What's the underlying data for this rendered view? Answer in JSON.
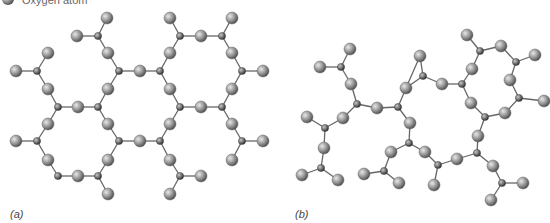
{
  "legend": {
    "oxygen_label": "Oxygen atom"
  },
  "panels": [
    {
      "label": "(a)",
      "description": "crystalline",
      "label_pos": [
        10,
        208
      ]
    },
    {
      "label": "(b)",
      "description": "amorphous",
      "label_pos": [
        295,
        208
      ]
    }
  ],
  "colors": {
    "oxygen": "#8a8a8a",
    "silicon": "#6a6a6a",
    "bond": "#666666"
  },
  "atoms": {
    "O": [
      [
        107,
        18
      ],
      [
        170,
        18
      ],
      [
        232,
        18
      ],
      [
        77,
        36
      ],
      [
        201,
        36
      ],
      [
        108,
        53
      ],
      [
        170,
        53
      ],
      [
        232,
        53
      ],
      [
        140,
        71
      ],
      [
        263,
        71
      ],
      [
        48,
        53
      ],
      [
        16,
        71
      ],
      [
        48,
        89
      ],
      [
        108,
        89
      ],
      [
        170,
        89
      ],
      [
        232,
        89
      ],
      [
        78,
        107
      ],
      [
        201,
        107
      ],
      [
        16,
        141
      ],
      [
        48,
        124
      ],
      [
        48,
        160
      ],
      [
        78,
        176
      ],
      [
        108,
        124
      ],
      [
        108,
        160
      ],
      [
        140,
        141
      ],
      [
        170,
        124
      ],
      [
        170,
        160
      ],
      [
        201,
        176
      ],
      [
        170,
        194
      ],
      [
        108,
        194
      ],
      [
        263,
        141
      ],
      [
        232,
        124
      ],
      [
        232,
        160
      ],
      [
        350,
        49
      ],
      [
        320,
        67
      ],
      [
        351,
        84
      ],
      [
        377,
        108
      ],
      [
        406,
        88
      ],
      [
        420,
        56
      ],
      [
        307,
        117
      ],
      [
        343,
        118
      ],
      [
        324,
        148
      ],
      [
        302,
        175
      ],
      [
        338,
        180
      ],
      [
        467,
        35
      ],
      [
        501,
        46
      ],
      [
        535,
        55
      ],
      [
        472,
        69
      ],
      [
        442,
        84
      ],
      [
        510,
        80
      ],
      [
        544,
        101
      ],
      [
        471,
        103
      ],
      [
        505,
        113
      ],
      [
        410,
        123
      ],
      [
        391,
        152
      ],
      [
        425,
        152
      ],
      [
        457,
        159
      ],
      [
        478,
        136
      ],
      [
        493,
        166
      ],
      [
        523,
        183
      ],
      [
        491,
        200
      ],
      [
        434,
        185
      ],
      [
        364,
        174
      ],
      [
        399,
        183
      ]
    ],
    "Si": [
      [
        98,
        36
      ],
      [
        180,
        36
      ],
      [
        222,
        36
      ],
      [
        119,
        71
      ],
      [
        160,
        71
      ],
      [
        242,
        71
      ],
      [
        37,
        71
      ],
      [
        58,
        107
      ],
      [
        98,
        107
      ],
      [
        180,
        107
      ],
      [
        222,
        107
      ],
      [
        37,
        141
      ],
      [
        58,
        176
      ],
      [
        98,
        176
      ],
      [
        119,
        141
      ],
      [
        160,
        141
      ],
      [
        180,
        176
      ],
      [
        242,
        141
      ],
      [
        341,
        67
      ],
      [
        357,
        104
      ],
      [
        398,
        107
      ],
      [
        325,
        128
      ],
      [
        321,
        168
      ],
      [
        480,
        51
      ],
      [
        516,
        62
      ],
      [
        462,
        84
      ],
      [
        423,
        76
      ],
      [
        519,
        98
      ],
      [
        485,
        117
      ],
      [
        409,
        143
      ],
      [
        438,
        165
      ],
      [
        477,
        153
      ],
      [
        502,
        183
      ],
      [
        384,
        171
      ]
    ]
  },
  "bonds": [
    [
      [
        98,
        36
      ],
      [
        107,
        18
      ]
    ],
    [
      [
        98,
        36
      ],
      [
        77,
        36
      ]
    ],
    [
      [
        98,
        36
      ],
      [
        108,
        53
      ]
    ],
    [
      [
        180,
        36
      ],
      [
        170,
        18
      ]
    ],
    [
      [
        180,
        36
      ],
      [
        201,
        36
      ]
    ],
    [
      [
        180,
        36
      ],
      [
        170,
        53
      ]
    ],
    [
      [
        222,
        36
      ],
      [
        232,
        18
      ]
    ],
    [
      [
        222,
        36
      ],
      [
        201,
        36
      ]
    ],
    [
      [
        222,
        36
      ],
      [
        232,
        53
      ]
    ],
    [
      [
        119,
        71
      ],
      [
        108,
        53
      ]
    ],
    [
      [
        119,
        71
      ],
      [
        140,
        71
      ]
    ],
    [
      [
        119,
        71
      ],
      [
        108,
        89
      ]
    ],
    [
      [
        160,
        71
      ],
      [
        140,
        71
      ]
    ],
    [
      [
        160,
        71
      ],
      [
        170,
        53
      ]
    ],
    [
      [
        160,
        71
      ],
      [
        170,
        89
      ]
    ],
    [
      [
        242,
        71
      ],
      [
        232,
        53
      ]
    ],
    [
      [
        242,
        71
      ],
      [
        263,
        71
      ]
    ],
    [
      [
        242,
        71
      ],
      [
        232,
        89
      ]
    ],
    [
      [
        37,
        71
      ],
      [
        16,
        71
      ]
    ],
    [
      [
        37,
        71
      ],
      [
        48,
        53
      ]
    ],
    [
      [
        37,
        71
      ],
      [
        48,
        89
      ]
    ],
    [
      [
        58,
        107
      ],
      [
        48,
        89
      ]
    ],
    [
      [
        58,
        107
      ],
      [
        78,
        107
      ]
    ],
    [
      [
        58,
        107
      ],
      [
        48,
        124
      ]
    ],
    [
      [
        98,
        107
      ],
      [
        78,
        107
      ]
    ],
    [
      [
        98,
        107
      ],
      [
        108,
        89
      ]
    ],
    [
      [
        98,
        107
      ],
      [
        108,
        124
      ]
    ],
    [
      [
        180,
        107
      ],
      [
        170,
        89
      ]
    ],
    [
      [
        180,
        107
      ],
      [
        201,
        107
      ]
    ],
    [
      [
        180,
        107
      ],
      [
        170,
        124
      ]
    ],
    [
      [
        222,
        107
      ],
      [
        201,
        107
      ]
    ],
    [
      [
        222,
        107
      ],
      [
        232,
        89
      ]
    ],
    [
      [
        222,
        107
      ],
      [
        232,
        124
      ]
    ],
    [
      [
        37,
        141
      ],
      [
        16,
        141
      ]
    ],
    [
      [
        37,
        141
      ],
      [
        48,
        124
      ]
    ],
    [
      [
        37,
        141
      ],
      [
        48,
        160
      ]
    ],
    [
      [
        58,
        176
      ],
      [
        48,
        160
      ]
    ],
    [
      [
        58,
        176
      ],
      [
        78,
        176
      ]
    ],
    [
      [
        98,
        176
      ],
      [
        78,
        176
      ]
    ],
    [
      [
        98,
        176
      ],
      [
        108,
        160
      ]
    ],
    [
      [
        98,
        176
      ],
      [
        108,
        194
      ]
    ],
    [
      [
        119,
        141
      ],
      [
        108,
        124
      ]
    ],
    [
      [
        119,
        141
      ],
      [
        140,
        141
      ]
    ],
    [
      [
        119,
        141
      ],
      [
        108,
        160
      ]
    ],
    [
      [
        160,
        141
      ],
      [
        140,
        141
      ]
    ],
    [
      [
        160,
        141
      ],
      [
        170,
        124
      ]
    ],
    [
      [
        160,
        141
      ],
      [
        170,
        160
      ]
    ],
    [
      [
        180,
        176
      ],
      [
        170,
        160
      ]
    ],
    [
      [
        180,
        176
      ],
      [
        201,
        176
      ]
    ],
    [
      [
        180,
        176
      ],
      [
        170,
        194
      ]
    ],
    [
      [
        242,
        141
      ],
      [
        232,
        124
      ]
    ],
    [
      [
        242,
        141
      ],
      [
        263,
        141
      ]
    ],
    [
      [
        242,
        141
      ],
      [
        232,
        160
      ]
    ],
    [
      [
        341,
        67
      ],
      [
        350,
        49
      ]
    ],
    [
      [
        341,
        67
      ],
      [
        320,
        67
      ]
    ],
    [
      [
        341,
        67
      ],
      [
        351,
        84
      ]
    ],
    [
      [
        357,
        104
      ],
      [
        351,
        84
      ]
    ],
    [
      [
        357,
        104
      ],
      [
        377,
        108
      ]
    ],
    [
      [
        357,
        104
      ],
      [
        343,
        118
      ]
    ],
    [
      [
        398,
        107
      ],
      [
        377,
        108
      ]
    ],
    [
      [
        398,
        107
      ],
      [
        406,
        88
      ]
    ],
    [
      [
        398,
        107
      ],
      [
        410,
        123
      ]
    ],
    [
      [
        406,
        88
      ],
      [
        420,
        56
      ]
    ],
    [
      [
        325,
        128
      ],
      [
        307,
        117
      ]
    ],
    [
      [
        325,
        128
      ],
      [
        343,
        118
      ]
    ],
    [
      [
        325,
        128
      ],
      [
        324,
        148
      ]
    ],
    [
      [
        321,
        168
      ],
      [
        324,
        148
      ]
    ],
    [
      [
        321,
        168
      ],
      [
        302,
        175
      ]
    ],
    [
      [
        321,
        168
      ],
      [
        338,
        180
      ]
    ],
    [
      [
        480,
        51
      ],
      [
        467,
        35
      ]
    ],
    [
      [
        480,
        51
      ],
      [
        501,
        46
      ]
    ],
    [
      [
        480,
        51
      ],
      [
        472,
        69
      ]
    ],
    [
      [
        516,
        62
      ],
      [
        501,
        46
      ]
    ],
    [
      [
        516,
        62
      ],
      [
        535,
        55
      ]
    ],
    [
      [
        516,
        62
      ],
      [
        510,
        80
      ]
    ],
    [
      [
        462,
        84
      ],
      [
        472,
        69
      ]
    ],
    [
      [
        462,
        84
      ],
      [
        442,
        84
      ]
    ],
    [
      [
        462,
        84
      ],
      [
        471,
        103
      ]
    ],
    [
      [
        423,
        76
      ],
      [
        442,
        84
      ]
    ],
    [
      [
        423,
        76
      ],
      [
        420,
        56
      ]
    ],
    [
      [
        423,
        76
      ],
      [
        406,
        88
      ]
    ],
    [
      [
        519,
        98
      ],
      [
        510,
        80
      ]
    ],
    [
      [
        519,
        98
      ],
      [
        544,
        101
      ]
    ],
    [
      [
        519,
        98
      ],
      [
        505,
        113
      ]
    ],
    [
      [
        485,
        117
      ],
      [
        471,
        103
      ]
    ],
    [
      [
        485,
        117
      ],
      [
        505,
        113
      ]
    ],
    [
      [
        485,
        117
      ],
      [
        478,
        136
      ]
    ],
    [
      [
        409,
        143
      ],
      [
        410,
        123
      ]
    ],
    [
      [
        409,
        143
      ],
      [
        391,
        152
      ]
    ],
    [
      [
        409,
        143
      ],
      [
        425,
        152
      ]
    ],
    [
      [
        438,
        165
      ],
      [
        425,
        152
      ]
    ],
    [
      [
        438,
        165
      ],
      [
        457,
        159
      ]
    ],
    [
      [
        438,
        165
      ],
      [
        434,
        185
      ]
    ],
    [
      [
        477,
        153
      ],
      [
        457,
        159
      ]
    ],
    [
      [
        477,
        153
      ],
      [
        478,
        136
      ]
    ],
    [
      [
        477,
        153
      ],
      [
        493,
        166
      ]
    ],
    [
      [
        502,
        183
      ],
      [
        493,
        166
      ]
    ],
    [
      [
        502,
        183
      ],
      [
        523,
        183
      ]
    ],
    [
      [
        502,
        183
      ],
      [
        491,
        200
      ]
    ],
    [
      [
        384,
        171
      ],
      [
        391,
        152
      ]
    ],
    [
      [
        384,
        171
      ],
      [
        364,
        174
      ]
    ],
    [
      [
        384,
        171
      ],
      [
        399,
        183
      ]
    ]
  ]
}
